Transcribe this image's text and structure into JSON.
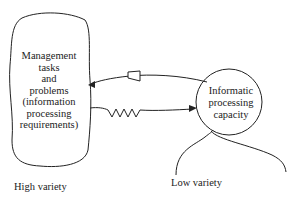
{
  "diagram": {
    "left_box": {
      "lines": [
        "Management",
        "tasks",
        "and",
        "problems",
        "(information",
        "processing",
        "requirements)"
      ]
    },
    "right_circle": {
      "lines": [
        "Informatic",
        "processing",
        "capacity"
      ]
    },
    "captions": {
      "left": "High variety",
      "right": "Low variety"
    },
    "connectors": [
      {
        "from": "right_circle",
        "to": "left_box",
        "style": "curved arrow with open triangle (amplifier)"
      },
      {
        "from": "left_box",
        "to": "right_circle",
        "style": "zigzag line with filled arrowhead (attenuator)"
      }
    ],
    "colors": {
      "stroke": "#222222",
      "background": "#ffffff"
    }
  }
}
